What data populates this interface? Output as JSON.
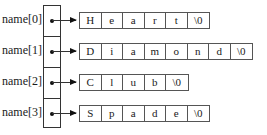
{
  "labels": [
    "name[0]",
    "name[1]",
    "name[2]",
    "name[3]"
  ],
  "strings": [
    {
      "word": "Heart",
      "chars": [
        "H",
        "e",
        "a",
        "r",
        "t",
        "\\0"
      ]
    },
    {
      "word": "Diamond",
      "chars": [
        "D",
        "i",
        "a",
        "m",
        "o",
        "n",
        "d",
        "\\0"
      ]
    },
    {
      "word": "Club",
      "chars": [
        "C",
        "l",
        "u",
        "b",
        "\\0"
      ]
    },
    {
      "word": "Spade",
      "chars": [
        "S",
        "p",
        "a",
        "d",
        "e",
        "\\0"
      ]
    }
  ]
}
